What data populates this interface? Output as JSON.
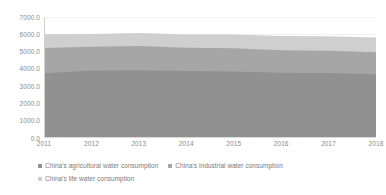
{
  "chart_data": {
    "type": "area",
    "stacked": true,
    "title": "",
    "xlabel": "",
    "ylabel": "",
    "x": [
      2011,
      2012,
      2013,
      2014,
      2015,
      2016,
      2017,
      2018
    ],
    "categories": [
      "2011",
      "2012",
      "2013",
      "2014",
      "2015",
      "2016",
      "2017",
      "2018"
    ],
    "series": [
      {
        "name": "China's agricultural water consumption",
        "color": "#919191",
        "values": [
          3743.6,
          3902.5,
          3921.5,
          3869.0,
          3852.2,
          3768.0,
          3766.4,
          3693.1
        ]
      },
      {
        "name": "China's industrial water consumption",
        "color": "#a6a6a6",
        "values": [
          1461.8,
          1380.7,
          1406.4,
          1356.1,
          1334.8,
          1308.0,
          1277.0,
          1261.6
        ]
      },
      {
        "name": "China's life water consumption",
        "color": "#cfcfcf",
        "values": [
          789.9,
          739.7,
          750.1,
          766.6,
          793.5,
          821.6,
          838.1,
          859.9
        ]
      }
    ],
    "ylim": [
      0.0,
      7000.0
    ],
    "yticks": [
      0.0,
      1000.0,
      2000.0,
      3000.0,
      4000.0,
      5000.0,
      6000.0,
      7000.0
    ],
    "ytick_labels": [
      "0.0",
      "1000.0",
      "2000.0",
      "3000.0",
      "4000.0",
      "5000.0",
      "6000.0",
      "7000.0"
    ],
    "grid": true,
    "legend_position": "bottom"
  },
  "legend": {
    "rows": [
      [
        {
          "label": "China's agricultural water consumption",
          "color": "#919191"
        },
        {
          "label": "China's industrial water consumption",
          "color": "#a6a6a6"
        }
      ],
      [
        {
          "label": "China's life water consumption",
          "color": "#cfcfcf"
        }
      ]
    ]
  }
}
